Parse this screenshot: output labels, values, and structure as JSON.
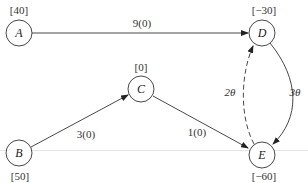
{
  "diagram": {
    "type": "network-flow",
    "nodes": [
      {
        "id": "A",
        "label": "A",
        "supply": "[40]"
      },
      {
        "id": "B",
        "label": "B",
        "supply": "[50]"
      },
      {
        "id": "C",
        "label": "C",
        "supply": "[0]"
      },
      {
        "id": "D",
        "label": "D",
        "supply": "[−30]"
      },
      {
        "id": "E",
        "label": "E",
        "supply": "[−60]"
      }
    ],
    "edges": [
      {
        "from": "A",
        "to": "D",
        "label": "9(0)",
        "style": "solid"
      },
      {
        "from": "B",
        "to": "C",
        "label": "3(0)",
        "style": "solid"
      },
      {
        "from": "C",
        "to": "E",
        "label": "1(0)",
        "style": "solid"
      },
      {
        "from": "D",
        "to": "E",
        "label": "3θ",
        "style": "solid"
      },
      {
        "from": "E",
        "to": "D",
        "label": "2θ",
        "style": "dashed"
      }
    ]
  }
}
